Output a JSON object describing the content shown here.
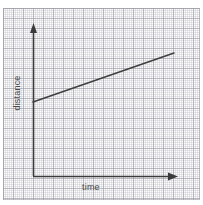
{
  "figure": {
    "name": "distance-time-graph",
    "background_color": "#ffffff",
    "paper_color": "#fdfdfd",
    "grid_minor_color": "#b9b9c3",
    "grid_major_color": "#9696a0",
    "axis_color": "#3a3a3a",
    "line_color": "#3f3f3f",
    "label_color": "#4a4a4a",
    "width": 203,
    "height": 205
  },
  "labels": {
    "y_axis": "distance",
    "x_axis": "time",
    "clipped_top_text": ""
  },
  "axes": {
    "y_axis_name": "y-axis-arrow",
    "x_axis_name": "x-axis-arrow",
    "origin_x": 33,
    "origin_y": 176,
    "y_top": 25,
    "x_right": 178
  },
  "chart_data": {
    "type": "line",
    "title": "",
    "subtitle": "",
    "xlabel": "time",
    "ylabel": "distance",
    "grid": true,
    "legend": "none",
    "xlim": [
      0,
      10
    ],
    "ylim": [
      0,
      10
    ],
    "xticks": [],
    "yticks": [],
    "annotations": [],
    "series": [
      {
        "name": "constant speed",
        "x": [
          0,
          10
        ],
        "y": [
          4.9,
          8.15
        ],
        "pixel_start": [
          33,
          102
        ],
        "pixel_end": [
          174,
          53
        ],
        "color": "#3f3f3f",
        "style": "solid",
        "marker": "none"
      }
    ]
  }
}
